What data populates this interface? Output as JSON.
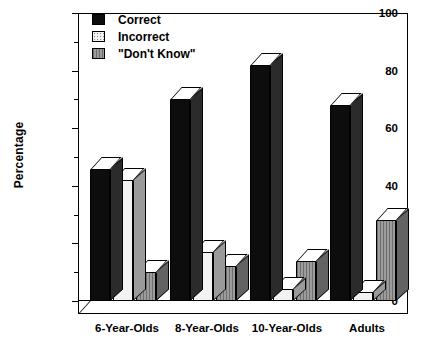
{
  "chart_data": {
    "type": "bar",
    "title": "",
    "xlabel": "",
    "ylabel": "Percentage",
    "ylim": [
      0,
      100
    ],
    "yticks": [
      0,
      20,
      40,
      60,
      80,
      100
    ],
    "grid": false,
    "legend_position": "top-left",
    "categories": [
      "6-Year-Olds",
      "8-Year-Olds",
      "10-Year-Olds",
      "Adults"
    ],
    "series": [
      {
        "name": "Correct",
        "values": [
          46,
          70,
          82,
          68
        ],
        "color": "#0d0d0d"
      },
      {
        "name": "Incorrect",
        "values": [
          42,
          17,
          4,
          3
        ],
        "color": "#f2f2f2"
      },
      {
        "name": "\"Don't Know\"",
        "values": [
          10,
          12,
          14,
          28
        ],
        "color": "#8f8f8f"
      }
    ]
  },
  "axis": {
    "y_title": "Percentage",
    "y_ticks": [
      "100",
      "80",
      "60",
      "40",
      "20",
      "0"
    ]
  },
  "legend": {
    "items": [
      {
        "label": "Correct"
      },
      {
        "label": "Incorrect"
      },
      {
        "label": "\"Don't Know\""
      }
    ]
  }
}
